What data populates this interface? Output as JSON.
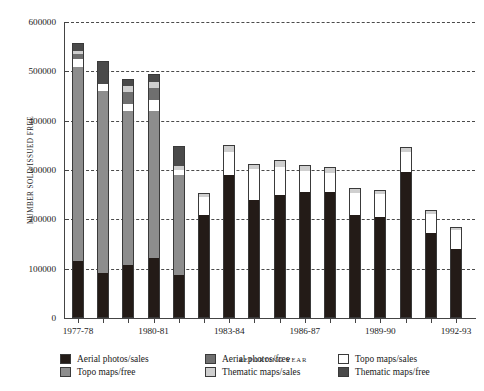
{
  "chart_data": {
    "type": "bar",
    "stacked": true,
    "title": "",
    "xlabel": "REPORTING YEAR",
    "ylabel": "NUMBER SOLD/ISSUED FREE",
    "ylim": [
      0,
      600000
    ],
    "yticks": [
      0,
      100000,
      200000,
      300000,
      400000,
      500000,
      600000
    ],
    "ytick_labels": [
      "0",
      "100000",
      "200000",
      "300000",
      "400000",
      "500000",
      "600000"
    ],
    "grid": true,
    "grid_style": "dashed-horizontal",
    "legend_position": "below-axes",
    "categories": [
      "1977-78",
      "1978-79",
      "1979-80",
      "1980-81",
      "1981-82",
      "1982-83",
      "1983-84",
      "1984-85",
      "1985-86",
      "1986-87",
      "1987-88",
      "1988-89",
      "1989-90",
      "1990-91",
      "1991-92",
      "1992-93"
    ],
    "tick_labels_shown": [
      "1977-78",
      "1980-81",
      "1983-84",
      "1986-87",
      "1989-90",
      "1992-93"
    ],
    "series": [
      {
        "name": "Aerial photos/sales",
        "key": "b-aps",
        "color": "#231b17",
        "values": [
          115000,
          92000,
          107000,
          121000,
          88000,
          208000,
          289000,
          240000,
          249000,
          255000,
          255000,
          209000,
          205000,
          296000,
          172000,
          140000
        ]
      },
      {
        "name": "Topo maps/free",
        "key": "b-tmf",
        "color": "#8d8d8d",
        "values": [
          393000,
          368000,
          313000,
          299000,
          201000,
          0,
          0,
          0,
          0,
          0,
          0,
          0,
          0,
          0,
          0,
          0
        ]
      },
      {
        "name": "Topo maps/sales",
        "key": "b-tms",
        "color": "#ffffff",
        "values": [
          18000,
          14000,
          14000,
          22000,
          12000,
          37000,
          48000,
          62000,
          58000,
          44000,
          38000,
          44000,
          46000,
          40000,
          38000,
          38000
        ]
      },
      {
        "name": "Aerial photos/free",
        "key": "b-apf",
        "color": "#6f6f6f",
        "values": [
          10000,
          0,
          24000,
          25000,
          0,
          0,
          0,
          0,
          0,
          0,
          0,
          0,
          0,
          0,
          0,
          0
        ]
      },
      {
        "name": "Thematic maps/sales",
        "key": "b-thms",
        "color": "#cfcfcf",
        "values": [
          5000,
          0,
          12000,
          12000,
          7000,
          9000,
          13000,
          10000,
          14000,
          11000,
          13000,
          10000,
          9000,
          11000,
          8000,
          7000
        ]
      },
      {
        "name": "Thematic maps/free",
        "key": "b-thmf",
        "color": "#4a4a4a",
        "values": [
          17000,
          46000,
          15000,
          16000,
          40000,
          0,
          0,
          0,
          0,
          0,
          0,
          0,
          0,
          0,
          0,
          0
        ]
      }
    ],
    "totals": [
      558000,
      520000,
      485000,
      495000,
      348000,
      254000,
      350000,
      312000,
      321000,
      310000,
      306000,
      263000,
      260000,
      347000,
      218000,
      185000
    ]
  },
  "legend": {
    "items": [
      {
        "label": "Aerial photos/sales",
        "key": "b-aps"
      },
      {
        "label": "Aerial photos/free",
        "key": "b-apf"
      },
      {
        "label": "Topo maps/sales",
        "key": "b-tms"
      },
      {
        "label": "Topo maps/free",
        "key": "b-tmf"
      },
      {
        "label": "Thematic maps/sales",
        "key": "b-thms"
      },
      {
        "label": "Thematic maps/free",
        "key": "b-thmf"
      }
    ]
  }
}
